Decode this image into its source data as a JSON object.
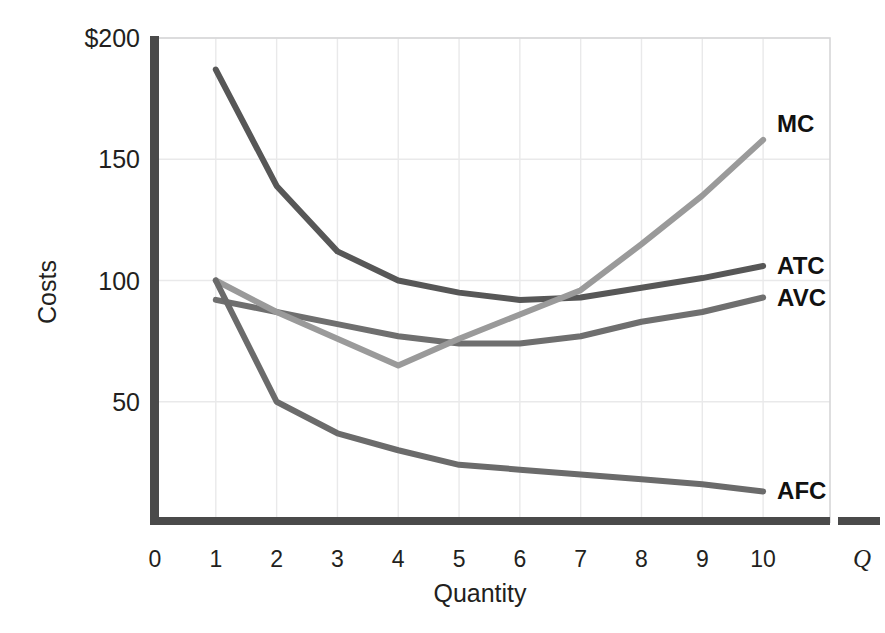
{
  "chart_data": {
    "type": "line",
    "title": "",
    "xlabel": "Quantity",
    "ylabel": "Costs",
    "x_axis_marker": "Q",
    "xlim": [
      0,
      11.1
    ],
    "ylim": [
      0,
      200
    ],
    "grid": true,
    "legend_position": "right-inline-end-of-line",
    "x_tick_labels": [
      "0",
      "1",
      "2",
      "3",
      "4",
      "5",
      "6",
      "7",
      "8",
      "9",
      "10"
    ],
    "x_tick_values": [
      0,
      1,
      2,
      3,
      4,
      5,
      6,
      7,
      8,
      9,
      10
    ],
    "y_tick_labels": [
      "50",
      "100",
      "150",
      "$200"
    ],
    "y_tick_values": [
      50,
      100,
      150,
      200
    ],
    "x": [
      1,
      2,
      3,
      4,
      5,
      6,
      7,
      8,
      9,
      10
    ],
    "series": [
      {
        "name": "ATC",
        "label": "ATC",
        "color": "#575757",
        "values": [
          187,
          139,
          112,
          100,
          95,
          92,
          93,
          97,
          101,
          106
        ]
      },
      {
        "name": "AVC",
        "label": "AVC",
        "color": "#6f6f6f",
        "values": [
          92,
          87,
          82,
          77,
          74,
          74,
          77,
          83,
          87,
          93
        ]
      },
      {
        "name": "MC",
        "label": "MC",
        "color": "#9a9a9a",
        "values": [
          100,
          87,
          76,
          65,
          76,
          86,
          96,
          115,
          135,
          158
        ]
      },
      {
        "name": "AFC",
        "label": "AFC",
        "color": "#6b6b6b",
        "values": [
          100,
          50,
          37,
          30,
          24,
          22,
          20,
          18,
          16,
          13
        ]
      }
    ]
  },
  "axes": {
    "y_title": "Costs",
    "x_title": "Quantity",
    "q_marker": "Q"
  },
  "colors": {
    "background": "#ffffff",
    "axis_bar": "#4a4a4a",
    "grid": "#e9e9ea",
    "frame": "#d6d6d8",
    "text": "#231f20",
    "atc": "#575757",
    "avc": "#6f6f6f",
    "mc": "#9a9a9a",
    "afc": "#6b6b6b"
  }
}
